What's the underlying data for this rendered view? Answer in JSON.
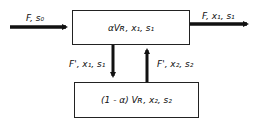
{
  "diagram": {
    "top_box": {
      "label": "αV_R, x1, s1",
      "text": "αVʀ, x₁, s₁"
    },
    "bottom_box": {
      "label": "(1-α)V_R, x2, s2",
      "text": "(1 - α) Vʀ, x₂, s₂"
    },
    "inlet": {
      "text": "F, s₀"
    },
    "outlet": {
      "text": "F, x₁, s₁"
    },
    "down_stream": {
      "text": "F', x₁, s₁"
    },
    "up_stream": {
      "text": "F', x₂, s₂"
    }
  }
}
